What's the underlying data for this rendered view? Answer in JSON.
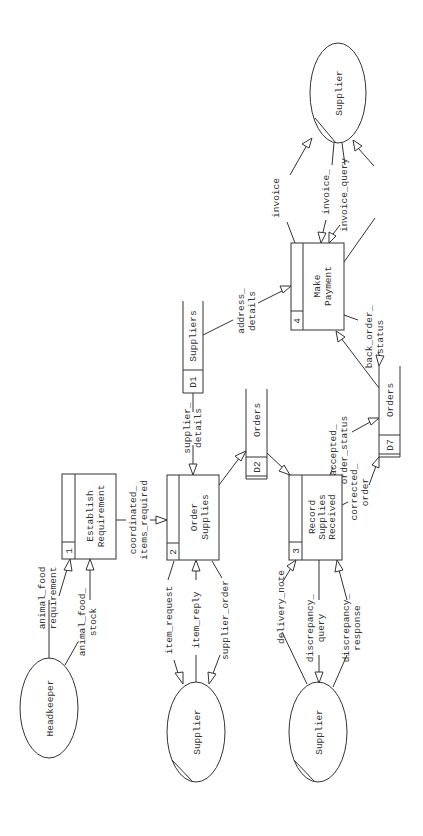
{
  "diagram": {
    "type": "data-flow-diagram",
    "orientation": "rotated-90-ccw",
    "processes": [
      {
        "id": "1",
        "label_lines": [
          "Establish",
          "Requirement"
        ]
      },
      {
        "id": "2",
        "label_lines": [
          "Order",
          "Supplies"
        ]
      },
      {
        "id": "3",
        "label_lines": [
          "Record",
          "Supplies",
          "Received"
        ]
      },
      {
        "id": "4",
        "label_lines": [
          "Make",
          "Payment"
        ]
      }
    ],
    "data_stores": [
      {
        "id": "D1",
        "label": "Suppliers"
      },
      {
        "id": "D2",
        "label": "Orders"
      },
      {
        "id": "D7",
        "label": "Orders"
      }
    ],
    "external_entities": [
      {
        "key": "headkeeper",
        "label": "Headkeeper"
      },
      {
        "key": "supplier_a",
        "label": "Supplier"
      },
      {
        "key": "supplier_b",
        "label": "Supplier"
      },
      {
        "key": "supplier_c",
        "label": "Supplier"
      }
    ],
    "flows": [
      {
        "key": "animal_food_requirement",
        "label_lines": [
          "animal_food",
          "requirement"
        ],
        "from": "Headkeeper",
        "to": "1"
      },
      {
        "key": "animal_food_stock",
        "label_lines": [
          "animal_food_",
          "stock"
        ],
        "from": "Headkeeper",
        "to": "1"
      },
      {
        "key": "coordinated_items_required",
        "label_lines": [
          "coordinated_",
          "items_required"
        ],
        "from": "1",
        "to": "2"
      },
      {
        "key": "item_request",
        "label_lines": [
          "item_request"
        ],
        "from": "2",
        "to": "Supplier"
      },
      {
        "key": "item_reply",
        "label_lines": [
          "item_reply"
        ],
        "from": "Supplier",
        "to": "2"
      },
      {
        "key": "supplier_order",
        "label_lines": [
          "supplier_order"
        ],
        "from": "2",
        "to": "Supplier"
      },
      {
        "key": "supplier_details",
        "label_lines": [
          "supplier_",
          "details"
        ],
        "from": "D1",
        "to": "2"
      },
      {
        "key": "orders_write",
        "label_lines": [],
        "from": "2",
        "to": "D2"
      },
      {
        "key": "orders_read",
        "label_lines": [],
        "from": "D2",
        "to": "3"
      },
      {
        "key": "delivery_note",
        "label_lines": [
          "delivery_note"
        ],
        "from": "Supplier",
        "to": "3"
      },
      {
        "key": "discrepancy_query",
        "label_lines": [
          "discrepancy_",
          "query"
        ],
        "from": "3",
        "to": "Supplier"
      },
      {
        "key": "discrepancy_response",
        "label_lines": [
          "discrepancy_",
          "response"
        ],
        "from": "Supplier",
        "to": "3"
      },
      {
        "key": "accepted_order_status",
        "label_lines": [
          "accepted_",
          "order_status"
        ],
        "from": "3",
        "to": "D7"
      },
      {
        "key": "corrected_order",
        "label_lines": [
          "corrected_",
          "order"
        ],
        "from": "3",
        "to": "D7"
      },
      {
        "key": "address_details",
        "label_lines": [
          "address_",
          "details"
        ],
        "from": "D1",
        "to": "4"
      },
      {
        "key": "back_order_status",
        "label_lines": [
          "back_order_",
          "status"
        ],
        "from": "4",
        "to": "D7"
      },
      {
        "key": "orders_to_payment",
        "label_lines": [],
        "from": "D7",
        "to": "4"
      },
      {
        "key": "payment_details",
        "label_lines": [
          "payment_",
          "details"
        ],
        "from": "4",
        "to": "Supplier"
      },
      {
        "key": "invoice",
        "label_lines": [
          "invoice"
        ],
        "from": "Supplier",
        "to": "4"
      },
      {
        "key": "invoice_response",
        "label_lines": [
          "invoice_",
          "response"
        ],
        "from": "Supplier",
        "to": "4"
      },
      {
        "key": "invoice_query",
        "label_lines": [
          "invoice_query"
        ],
        "from": "4",
        "to": "Supplier"
      }
    ]
  },
  "colors": {
    "stroke": "#333333",
    "background": "#ffffff",
    "text": "#333333"
  }
}
